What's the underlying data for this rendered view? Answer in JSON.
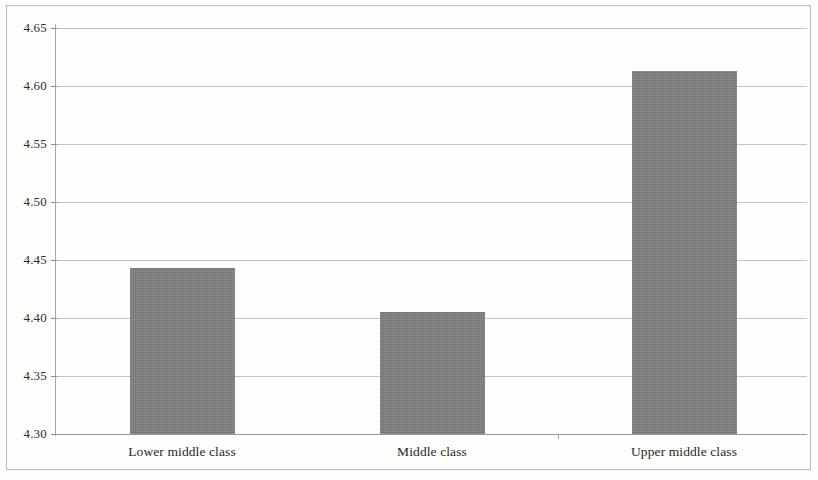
{
  "chart_data": {
    "type": "bar",
    "title": "",
    "subtitle": "",
    "xlabel": "",
    "ylabel": "",
    "categories": [
      "Lower middle class",
      "Middle class",
      "Upper middle class"
    ],
    "values": [
      4.443,
      4.405,
      4.613
    ],
    "ylim": [
      4.3,
      4.65
    ],
    "ytick_labels": [
      "4.65",
      "4.60",
      "4.55",
      "4.50",
      "4.45",
      "4.40",
      "4.35",
      "4.30"
    ],
    "ytick_values": [
      4.65,
      4.6,
      4.55,
      4.5,
      4.45,
      4.4,
      4.35,
      4.3
    ],
    "grid": true,
    "legend": null,
    "legend_position": "none",
    "series": [
      {
        "name": "",
        "values": [
          4.443,
          4.405,
          4.613
        ],
        "color": "#7e7e7e"
      }
    ],
    "annotations": []
  },
  "style": {
    "bar_color": "#7e7e7e",
    "grid_color": "#c2c2bd",
    "axis_color": "#a7a7a2",
    "frame_color": "#b9b9b5",
    "background": "#fefefd",
    "text_color": "#2e2e2e"
  }
}
